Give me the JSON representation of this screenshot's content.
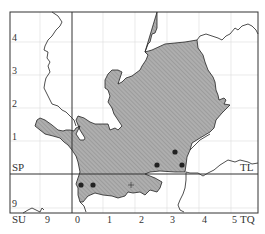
{
  "map": {
    "type": "distribution-map",
    "grid_squares": {
      "top_left": "SP",
      "top_right": "TL",
      "bottom_left": "SU",
      "bottom_right": "TQ"
    },
    "y_axis_labels": [
      "4",
      "3",
      "2",
      "1",
      "9"
    ],
    "x_axis_labels": [
      "9",
      "0",
      "1",
      "2",
      "3",
      "4",
      "5"
    ],
    "colors": {
      "region_fill": "#a9a9a9",
      "hatch": "#8c8c8c",
      "border": "#222222",
      "grid": "#d8d8d8",
      "dot": "#222222"
    },
    "records": [
      {
        "type": "dot",
        "x": 175,
        "y": 152
      },
      {
        "type": "dot",
        "x": 157,
        "y": 165
      },
      {
        "type": "dot",
        "x": 182,
        "y": 165
      },
      {
        "type": "dot",
        "x": 81,
        "y": 185
      },
      {
        "type": "dot",
        "x": 93,
        "y": 185
      },
      {
        "type": "plus",
        "x": 131,
        "y": 185
      }
    ]
  }
}
